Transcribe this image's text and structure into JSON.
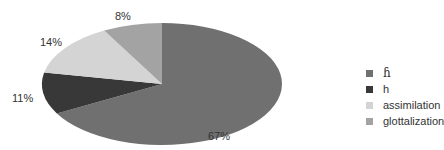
{
  "chart_data": {
    "type": "pie",
    "title": "",
    "start_angle_deg": 90,
    "direction": "clockwise",
    "categories": [
      "ɦ",
      "h",
      "assimilation",
      "glottalization"
    ],
    "values": [
      67,
      11,
      14,
      8
    ],
    "labels": [
      "67%",
      "11%",
      "14%",
      "8%"
    ],
    "colors": [
      "#707070",
      "#383838",
      "#d4d4d4",
      "#a3a3a3"
    ],
    "legend_position": "right",
    "grid": false
  },
  "legend": {
    "items": [
      {
        "label": "ɦ",
        "color": "#707070"
      },
      {
        "label": "h",
        "color": "#383838"
      },
      {
        "label": "assimilation",
        "color": "#d4d4d4"
      },
      {
        "label": "glottalization",
        "color": "#a3a3a3"
      }
    ]
  },
  "slice_labels": {
    "s0": "67%",
    "s1": "11%",
    "s2": "14%",
    "s3": "8%"
  }
}
